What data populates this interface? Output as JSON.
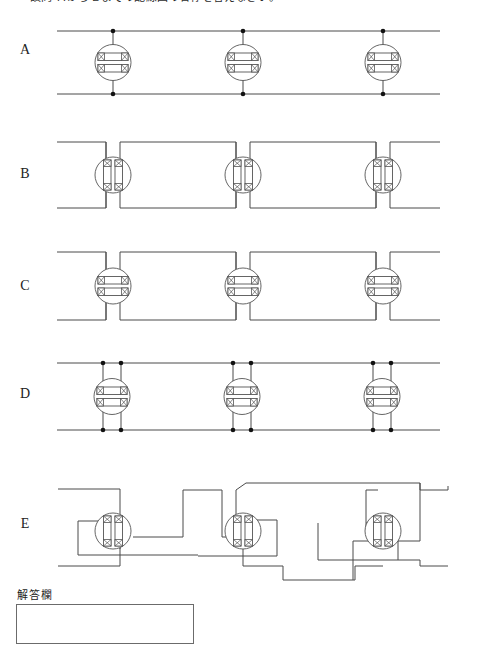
{
  "page": {
    "question_text": "設問 ＡからＥまでの配線図の名称を答えなさい。",
    "answer_label": "解答欄",
    "line_color": "#4a4a4a",
    "text_color": "#222222",
    "background": "#ffffff"
  },
  "rows": [
    {
      "id": "A",
      "label": "A",
      "symbol_orientation": "horizontal",
      "junction_dots": 6,
      "description": "two straight horizontal buses joined by three vertical links through horizontal terminal blocks"
    },
    {
      "id": "B",
      "label": "B",
      "symbol_orientation": "vertical",
      "junction_dots": 0,
      "description": "stepped buses entering three vertical terminal blocks"
    },
    {
      "id": "C",
      "label": "C",
      "symbol_orientation": "horizontal",
      "junction_dots": 0,
      "description": "stepped buses entering three horizontal terminal blocks"
    },
    {
      "id": "D",
      "label": "D",
      "symbol_orientation": "horizontal",
      "junction_dots": 12,
      "description": "two horizontal buses with paired vertical links at each horizontal terminal block"
    },
    {
      "id": "E",
      "label": "E",
      "symbol_orientation": "vertical",
      "junction_dots": 0,
      "description": "crossed / staggered routing through three vertical terminal blocks"
    }
  ],
  "answer_field": {
    "value": "",
    "placeholder": ""
  }
}
